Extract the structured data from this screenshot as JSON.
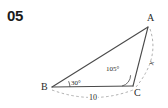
{
  "problem": {
    "number": "05"
  },
  "figure": {
    "type": "triangle-diagram",
    "vertices": [
      {
        "name": "A",
        "label": "A",
        "x": 148,
        "y": 27
      },
      {
        "name": "B",
        "label": "B",
        "x": 52,
        "y": 87
      },
      {
        "name": "C",
        "label": "C",
        "x": 133,
        "y": 86
      }
    ],
    "angles": [
      {
        "at": "B",
        "label": "30°",
        "value": 30
      },
      {
        "at": "C",
        "label": "105°",
        "value": 105
      }
    ],
    "sides": [
      {
        "from": "B",
        "to": "C",
        "label": "10",
        "value": 10,
        "style": "dashed-measure"
      },
      {
        "from": "A",
        "to": "C",
        "label": "x",
        "value": null,
        "style": "dashed-measure"
      }
    ],
    "stroke_color": "#4a4a4a",
    "dash_color": "#9a9a9a",
    "background": "#ffffff"
  }
}
